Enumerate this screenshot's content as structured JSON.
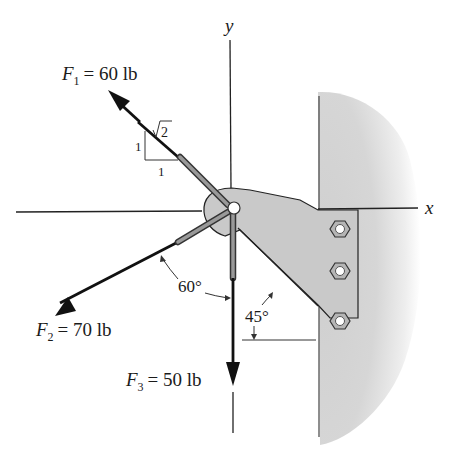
{
  "diagram": {
    "type": "statics-force-diagram",
    "axes": {
      "x_label": "x",
      "y_label": "y"
    },
    "forces": [
      {
        "id": "F1",
        "symbol": "F",
        "subscript": "1",
        "equals": "= 60 lb",
        "magnitude": 60,
        "unit": "lb",
        "direction": "up-left",
        "slope": {
          "rise": "1",
          "run": "1",
          "hyp_root": "2"
        }
      },
      {
        "id": "F2",
        "symbol": "F",
        "subscript": "2",
        "equals": "= 70 lb",
        "magnitude": 70,
        "unit": "lb",
        "direction": "down-left",
        "angle_label": "60°"
      },
      {
        "id": "F3",
        "symbol": "F",
        "subscript": "3",
        "equals": "= 50 lb",
        "magnitude": 50,
        "unit": "lb",
        "direction": "down"
      }
    ],
    "bracket": {
      "angle_label": "45°",
      "bolt_count": 3
    },
    "colors": {
      "ink": "#111111",
      "bracket_fill": "#c8c8c8",
      "wall_fill": "#d9d9d9",
      "rod_fill": "#8a8a8a"
    }
  }
}
